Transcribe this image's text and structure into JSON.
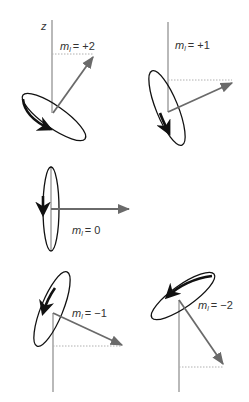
{
  "figure": {
    "axis_label": "z",
    "colors": {
      "axis": "#8a8a8a",
      "vector": "#6a6a6a",
      "orbit": "#111111",
      "dotted": "#b0b0b0"
    },
    "panels": [
      {
        "id": "ml-plus-2",
        "m_symbol": "m",
        "sub": "l",
        "eq": "= +2"
      },
      {
        "id": "ml-plus-1",
        "m_symbol": "m",
        "sub": "l",
        "eq": "= +1"
      },
      {
        "id": "ml-0",
        "m_symbol": "m",
        "sub": "l",
        "eq": "= 0"
      },
      {
        "id": "ml-minus-1",
        "m_symbol": "m",
        "sub": "l",
        "eq": "= −1"
      },
      {
        "id": "ml-minus-2",
        "m_symbol": "m",
        "sub": "l",
        "eq": "= −2"
      }
    ]
  }
}
